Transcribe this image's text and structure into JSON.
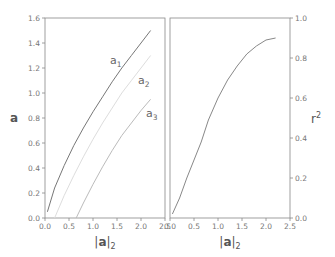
{
  "chart_data": [
    {
      "type": "line",
      "title": "",
      "xlabel": "|a|",
      "xlabel_subscript": "2",
      "ylabel": "a",
      "xlim": [
        0.0,
        2.5
      ],
      "ylim": [
        0.0,
        1.6
      ],
      "xticks": [
        "0.0",
        "0.5",
        "1.0",
        "1.5",
        "2.0",
        "2.5"
      ],
      "yticks": [
        "0.0",
        "0.2",
        "0.4",
        "0.6",
        "0.8",
        "1.0",
        "1.2",
        "1.4",
        "1.6"
      ],
      "grid": false,
      "series": [
        {
          "name": "a1",
          "label_main": "a",
          "label_sub": "1",
          "color": "#777777",
          "x": [
            0.05,
            0.2,
            0.4,
            0.6,
            0.8,
            1.0,
            1.2,
            1.4,
            1.6,
            1.8,
            2.0,
            2.2
          ],
          "y": [
            0.05,
            0.24,
            0.42,
            0.58,
            0.72,
            0.85,
            0.97,
            1.09,
            1.2,
            1.3,
            1.4,
            1.5
          ]
        },
        {
          "name": "a2",
          "label_main": "a",
          "label_sub": "2",
          "color": "#dddddd",
          "x": [
            0.2,
            0.4,
            0.6,
            0.8,
            1.0,
            1.2,
            1.4,
            1.6,
            1.8,
            2.0,
            2.2
          ],
          "y": [
            0.0,
            0.18,
            0.34,
            0.49,
            0.63,
            0.76,
            0.88,
            1.0,
            1.1,
            1.2,
            1.3
          ]
        },
        {
          "name": "a3",
          "label_main": "a",
          "label_sub": "3",
          "color": "#bbbbbb",
          "x": [
            0.65,
            0.8,
            1.0,
            1.2,
            1.4,
            1.6,
            1.8,
            2.0,
            2.2
          ],
          "y": [
            0.0,
            0.12,
            0.27,
            0.41,
            0.54,
            0.66,
            0.76,
            0.86,
            0.95
          ]
        }
      ]
    },
    {
      "type": "line",
      "title": "",
      "xlabel": "|a|",
      "xlabel_subscript": "2",
      "ylabel": "r",
      "ylabel_superscript": "2",
      "ylabel_position": "right",
      "xlim": [
        0.0,
        2.5
      ],
      "ylim": [
        0.0,
        1.0
      ],
      "xticks": [
        "0.0",
        "0.5",
        "1.0",
        "1.5",
        "2.0",
        "2.5"
      ],
      "yticks": [
        "0.0",
        "0.2",
        "0.4",
        "0.6",
        "0.8",
        "1.0"
      ],
      "grid": false,
      "series": [
        {
          "name": "r2",
          "color": "#888888",
          "x": [
            0.05,
            0.2,
            0.35,
            0.5,
            0.65,
            0.8,
            1.0,
            1.2,
            1.4,
            1.6,
            1.8,
            2.0,
            2.2
          ],
          "y": [
            0.02,
            0.1,
            0.2,
            0.29,
            0.38,
            0.49,
            0.6,
            0.69,
            0.76,
            0.82,
            0.86,
            0.89,
            0.9
          ]
        }
      ]
    }
  ]
}
